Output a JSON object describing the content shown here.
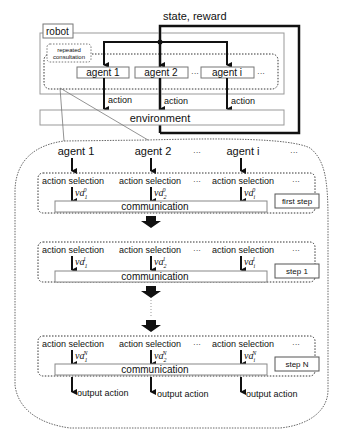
{
  "top": {
    "input_label": "state, reward",
    "robot_label": "robot",
    "consult_label_1": "repeated",
    "consult_label_2": "consultation",
    "agents": [
      "agent 1",
      "agent 2",
      "agent i"
    ],
    "action_labels": [
      "action",
      "action",
      "action"
    ],
    "environment_label": "environment",
    "ellipsis": "···"
  },
  "detail": {
    "agents": [
      "agent 1",
      "agent 2",
      "agent i"
    ],
    "steps": [
      {
        "label": "first step",
        "sup": "0",
        "selections": [
          "action selection",
          "action selection",
          "action selection"
        ],
        "comm": "communication"
      },
      {
        "label": "step 1",
        "sup": "1",
        "selections": [
          "action selection",
          "action selection",
          "action selection"
        ],
        "comm": "communication"
      },
      {
        "label": "step N",
        "sup": "N",
        "selections": [
          "action selection",
          "action selection",
          "action selection"
        ],
        "comm": "communication"
      }
    ],
    "va_base": "va",
    "subs": [
      "1",
      "2",
      "i"
    ],
    "outputs": [
      "output action",
      "output action",
      "output action"
    ],
    "ellipsis": "···"
  },
  "colors": {
    "line": "#111111",
    "box": "#888888",
    "dotted": "#333333"
  }
}
